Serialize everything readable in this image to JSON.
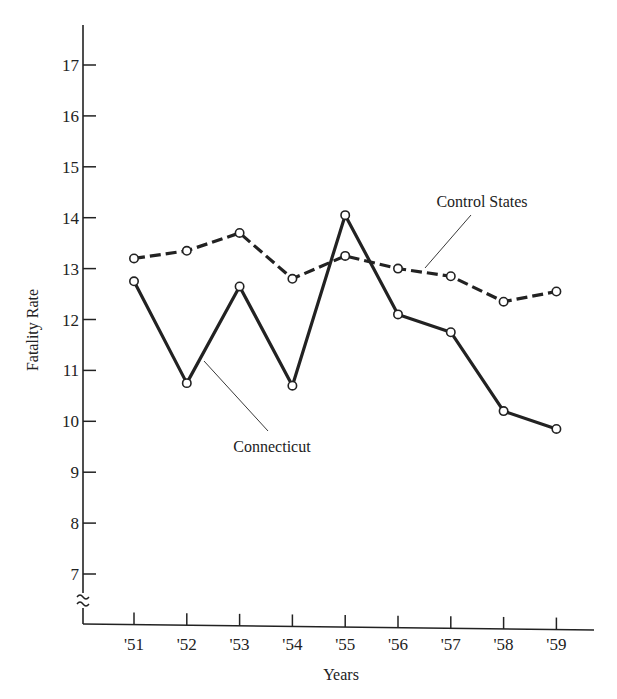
{
  "chart_data": {
    "type": "line",
    "title": "",
    "xlabel": "Years",
    "ylabel": "Fatality Rate",
    "categories": [
      "'51",
      "'52",
      "'53",
      "'54",
      "'55",
      "'56",
      "'57",
      "'58",
      "'59"
    ],
    "yticks": [
      7,
      8,
      9,
      10,
      11,
      12,
      13,
      14,
      15,
      16,
      17
    ],
    "ylim": [
      6.5,
      17.5
    ],
    "axis_break": true,
    "grid": false,
    "legend_position": "inline annotations",
    "series": [
      {
        "name": "Control States",
        "style": "dashed",
        "values": [
          13.2,
          13.35,
          13.7,
          12.8,
          13.25,
          13.0,
          12.85,
          12.35,
          12.55
        ]
      },
      {
        "name": "Connecticut",
        "style": "solid",
        "values": [
          12.75,
          10.75,
          12.65,
          10.7,
          14.05,
          12.1,
          11.75,
          10.2,
          9.85
        ]
      }
    ],
    "annotations": [
      {
        "text": "Control States",
        "points_to": "Control States"
      },
      {
        "text": "Connecticut",
        "points_to": "Connecticut"
      }
    ]
  },
  "colors": {
    "ink": "#222222",
    "background": "#ffffff"
  }
}
